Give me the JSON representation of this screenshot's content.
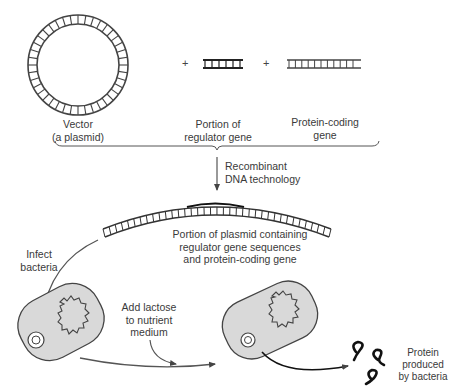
{
  "diagram": {
    "inputs": [
      {
        "id": "vector",
        "label_line1": "Vector",
        "label_line2": "(a plasmid)"
      },
      {
        "id": "regulator",
        "label_line1": "Portion of",
        "label_line2": "regulator gene"
      },
      {
        "id": "coding",
        "label_line1": "Protein-coding",
        "label_line2": "gene"
      }
    ],
    "plus_sign": "+",
    "step_arrow": {
      "line1": "Recombinant",
      "line2": "DNA technology"
    },
    "recombinant_plasmid": {
      "line1": "Portion of plasmid containing",
      "line2": "regulator gene sequences",
      "line3": "and protein-coding gene"
    },
    "infect": {
      "line1": "Infect",
      "line2": "bacteria"
    },
    "lactose": {
      "line1": "Add lactose",
      "line2": "to nutrient",
      "line3": "medium"
    },
    "output": {
      "line1": "Protein",
      "line2": "produced",
      "line3": "by bacteria"
    },
    "colors": {
      "stroke": "#333333",
      "cell_fill": "#d9d9d9",
      "background": "#ffffff"
    }
  }
}
